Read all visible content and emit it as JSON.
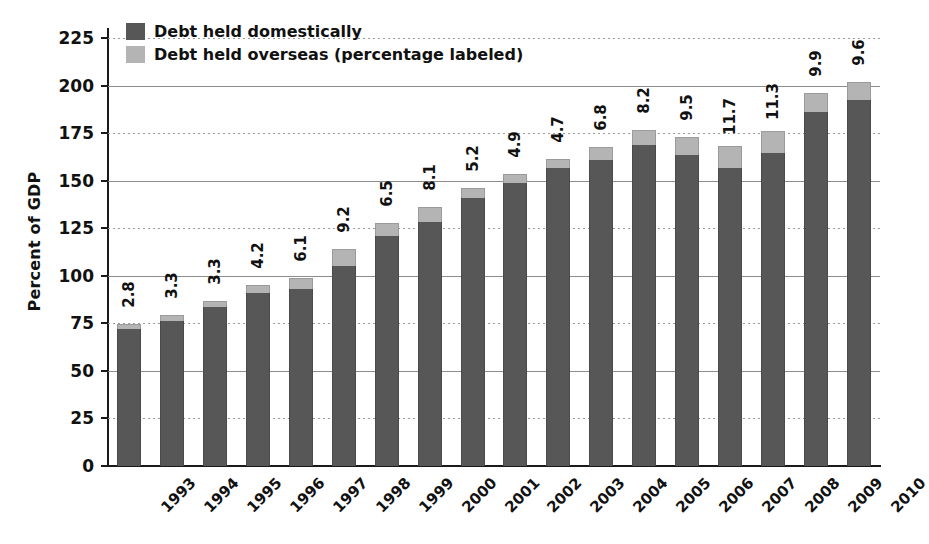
{
  "chart_data": {
    "type": "bar",
    "subtype": "stacked",
    "title": "",
    "xlabel": "",
    "ylabel": "Percent of GDP",
    "ylim": [
      0,
      225
    ],
    "ytick_step": 25,
    "yticks": [
      "225",
      "200",
      "175",
      "150",
      "125",
      "100",
      "75",
      "50",
      "25",
      "0"
    ],
    "grid": true,
    "legend_position": "top-left",
    "categories": [
      "1993",
      "1994",
      "1995",
      "1996",
      "1997",
      "1998",
      "1999",
      "2000",
      "2001",
      "2002",
      "2003",
      "2004",
      "2005",
      "2006",
      "2007",
      "2008",
      "2009",
      "2010"
    ],
    "series": [
      {
        "name": "Debt held domestically",
        "color": "#575757",
        "values": [
          72.0,
          76.1,
          83.4,
          91.2,
          92.9,
          105.0,
          121.0,
          128.3,
          140.8,
          148.6,
          156.8,
          161.0,
          168.6,
          163.5,
          156.5,
          164.7,
          186.1,
          192.4
        ]
      },
      {
        "name": "Debt held overseas (percentage labeled)",
        "color": "#b4b4b4",
        "values": [
          2.8,
          3.3,
          3.3,
          4.2,
          6.1,
          9.2,
          6.5,
          8.1,
          5.2,
          4.9,
          4.7,
          6.8,
          8.2,
          9.5,
          11.7,
          11.3,
          9.9,
          9.6
        ]
      }
    ],
    "totals": [
      74.8,
      79.4,
      86.7,
      95.4,
      99.0,
      114.2,
      127.5,
      136.4,
      146.0,
      153.5,
      161.5,
      167.8,
      176.8,
      173.0,
      168.2,
      176.0,
      196.0,
      202.0
    ],
    "data_labels": [
      "2.8",
      "3.3",
      "3.3",
      "4.2",
      "6.1",
      "9.2",
      "6.5",
      "8.1",
      "5.2",
      "4.9",
      "4.7",
      "6.8",
      "8.2",
      "9.5",
      "11.7",
      "11.3",
      "9.9",
      "9.6"
    ],
    "data_label_note": "Labels show the overseas-held share as a percentage of GDP"
  },
  "legend": {
    "items": [
      {
        "label": "Debt held domestically",
        "swatch": "dark-gray-swatch"
      },
      {
        "label": "Debt held overseas (percentage labeled)",
        "swatch": "light-gray-swatch"
      }
    ]
  },
  "axes": {
    "y_title": "Percent of GDP"
  }
}
